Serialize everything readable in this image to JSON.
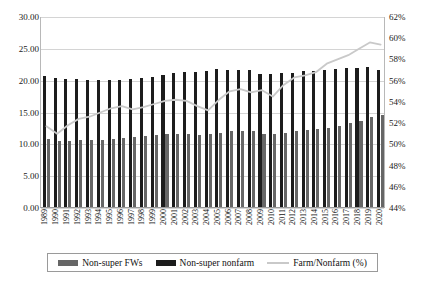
{
  "chart_data": {
    "type": "bar",
    "title": "",
    "subtitle": "",
    "xlabel": "",
    "ylabel": "",
    "y2label": "",
    "grid": true,
    "legend_position": "bottom",
    "categories": [
      "1989",
      "1990",
      "1991",
      "1992",
      "1993",
      "1994",
      "1995",
      "1996",
      "1997",
      "1998",
      "1999",
      "2000",
      "2001",
      "2002",
      "2003",
      "2004",
      "2005",
      "2006",
      "2007",
      "2008",
      "2009",
      "2010",
      "2011",
      "2012",
      "2013",
      "2014",
      "2015",
      "2016",
      "2017",
      "2018",
      "2019",
      "2020"
    ],
    "ylim": [
      0,
      30
    ],
    "yticks": [
      "0.00",
      "5.00",
      "10.00",
      "15.00",
      "20.00",
      "25.00",
      "30.00"
    ],
    "y2lim": [
      44,
      62
    ],
    "y2ticks": [
      "44%",
      "46%",
      "48%",
      "50%",
      "52%",
      "54%",
      "56%",
      "58%",
      "60%",
      "62%"
    ],
    "series": [
      {
        "name": "Non-super nonfarm",
        "type": "bar",
        "color": "#1c1c1c",
        "axis": "left",
        "values": [
          20.5,
          20.2,
          20.1,
          20.1,
          20.0,
          19.9,
          20.0,
          20.0,
          20.1,
          20.2,
          20.4,
          20.8,
          21.1,
          21.2,
          21.2,
          21.4,
          21.6,
          21.5,
          21.5,
          21.5,
          20.9,
          20.9,
          21.0,
          21.1,
          21.3,
          21.4,
          21.5,
          21.7,
          21.8,
          21.9,
          22.0,
          21.5
        ]
      },
      {
        "name": "Non-super FWs",
        "type": "bar",
        "color": "#666666",
        "axis": "left",
        "values": [
          10.7,
          10.4,
          10.4,
          10.5,
          10.5,
          10.5,
          10.7,
          10.8,
          11.0,
          11.2,
          11.3,
          11.4,
          11.4,
          11.4,
          11.3,
          11.4,
          11.7,
          11.9,
          12.0,
          12.0,
          11.5,
          11.4,
          11.7,
          11.9,
          12.1,
          12.2,
          12.4,
          12.8,
          13.2,
          13.5,
          14.1,
          14.5
        ]
      },
      {
        "name": "Farm/Nonfarm (%)",
        "type": "line",
        "color": "#c9c9c9",
        "axis": "right",
        "values": [
          51.7,
          51.0,
          51.8,
          52.4,
          52.6,
          53.0,
          53.4,
          53.6,
          53.3,
          53.5,
          53.8,
          54.1,
          54.2,
          54.1,
          53.6,
          53.2,
          54.2,
          55.0,
          55.2,
          54.9,
          55.1,
          54.5,
          55.6,
          56.3,
          56.5,
          56.8,
          57.6,
          58.0,
          58.4,
          59.0,
          59.6,
          59.4
        ]
      }
    ]
  },
  "legend": {
    "items": [
      {
        "label": "Non-super FWs",
        "marker": "gray-bar-swatch"
      },
      {
        "label": "Non-super nonfarm",
        "marker": "black-bar-swatch"
      },
      {
        "label": "Farm/Nonfarm (%)",
        "marker": "gray-line-swatch"
      }
    ]
  }
}
